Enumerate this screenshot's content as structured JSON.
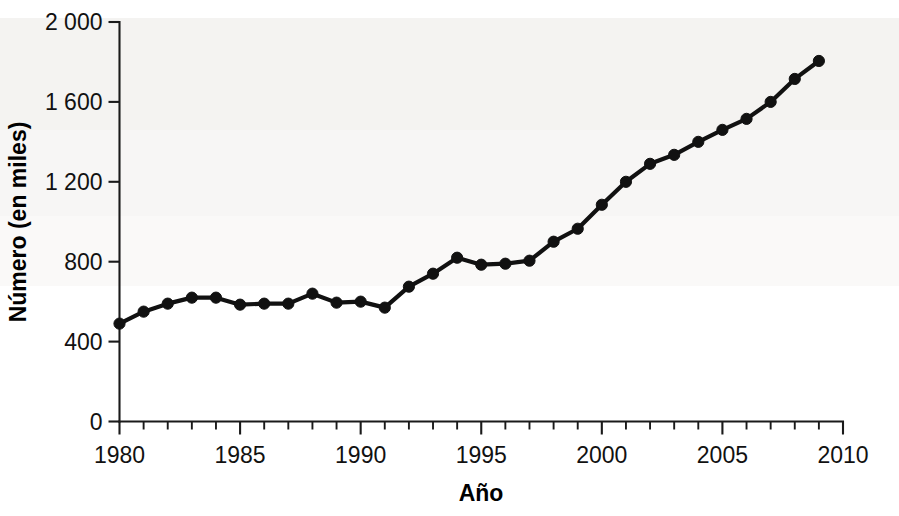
{
  "chart_data": {
    "type": "line",
    "title": "",
    "xlabel": "Año",
    "ylabel": "Número (en miles)",
    "xlim": [
      1980,
      2010
    ],
    "ylim": [
      0,
      2000
    ],
    "grid": false,
    "legend": "none",
    "y_tick_labels": [
      "0",
      "400",
      "800",
      "1 200",
      "1 600",
      "2 000"
    ],
    "y_tick_values": [
      0,
      400,
      800,
      1200,
      1600,
      2000
    ],
    "x_tick_labels": [
      "1980",
      "1985",
      "1990",
      "1995",
      "2000",
      "2005",
      "2010"
    ],
    "x_tick_values": [
      1980,
      1985,
      1990,
      1995,
      2000,
      2005,
      2010
    ],
    "x_minor_step": 1,
    "marker": "circle",
    "line_color": "#111111",
    "marker_color": "#111111",
    "background_color": "#ffffff",
    "x": [
      1980,
      1981,
      1982,
      1983,
      1984,
      1985,
      1986,
      1987,
      1988,
      1989,
      1990,
      1991,
      1992,
      1993,
      1994,
      1995,
      1996,
      1997,
      1998,
      1999,
      2000,
      2001,
      2002,
      2003,
      2004,
      2005,
      2006,
      2007,
      2008,
      2009
    ],
    "values": [
      490,
      550,
      590,
      620,
      620,
      585,
      590,
      590,
      640,
      595,
      600,
      570,
      675,
      740,
      820,
      785,
      790,
      805,
      900,
      965,
      1085,
      1200,
      1290,
      1335,
      1400,
      1460,
      1515,
      1600,
      1715,
      1805
    ],
    "series": [
      {
        "name": "Número (en miles)",
        "values": [
          490,
          550,
          590,
          620,
          620,
          585,
          590,
          590,
          640,
          595,
          600,
          570,
          675,
          740,
          820,
          785,
          790,
          805,
          900,
          965,
          1085,
          1200,
          1290,
          1335,
          1400,
          1460,
          1515,
          1600,
          1715,
          1805
        ]
      }
    ]
  }
}
